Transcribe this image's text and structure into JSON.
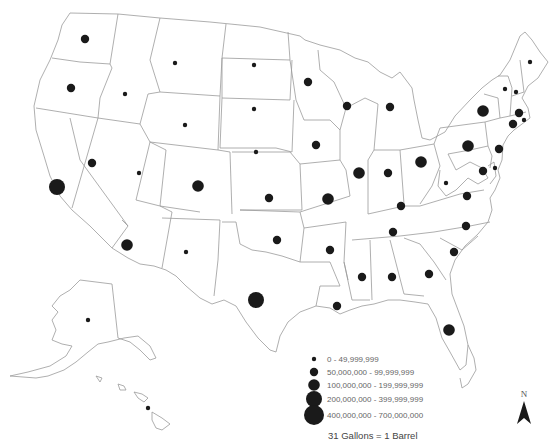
{
  "map": {
    "title": "",
    "subject": "Annual petroleum consumption by state (gallons)",
    "marker_color": "#1a1a1a",
    "border_color": "#9a9a9a"
  },
  "legend": {
    "classes": [
      {
        "id": 1,
        "label": "0 - 49,999,999"
      },
      {
        "id": 2,
        "label": "50,000,000 - 99,999,999"
      },
      {
        "id": 3,
        "label": "100,000,000 - 199,999,999"
      },
      {
        "id": 4,
        "label": "200,000,000 - 399,999,999"
      },
      {
        "id": 5,
        "label": "400,000,000 - 700,000,000"
      }
    ],
    "note": "31 Gallons = 1 Barrel"
  },
  "north_arrow": {
    "label": "N"
  },
  "states": [
    {
      "state": "WA",
      "class": 2
    },
    {
      "state": "OR",
      "class": 2
    },
    {
      "state": "CA",
      "class": 4
    },
    {
      "state": "ID",
      "class": 1
    },
    {
      "state": "MT",
      "class": 1
    },
    {
      "state": "WY",
      "class": 1
    },
    {
      "state": "NV",
      "class": 2
    },
    {
      "state": "UT",
      "class": 1
    },
    {
      "state": "CO",
      "class": 3
    },
    {
      "state": "ND",
      "class": 1
    },
    {
      "state": "SD",
      "class": 1
    },
    {
      "state": "NE",
      "class": 1
    },
    {
      "state": "KS",
      "class": 2
    },
    {
      "state": "OK",
      "class": 2
    },
    {
      "state": "NM",
      "class": 1
    },
    {
      "state": "AZ",
      "class": 3
    },
    {
      "state": "TX",
      "class": 4
    },
    {
      "state": "AK",
      "class": 1
    },
    {
      "state": "HI",
      "class": 1
    },
    {
      "state": "MN",
      "class": 2
    },
    {
      "state": "IA",
      "class": 2
    },
    {
      "state": "MO",
      "class": 3
    },
    {
      "state": "AR",
      "class": 2
    },
    {
      "state": "LA",
      "class": 2
    },
    {
      "state": "WI",
      "class": 2
    },
    {
      "state": "IL",
      "class": 3
    },
    {
      "state": "MI",
      "class": 2
    },
    {
      "state": "IN",
      "class": 2
    },
    {
      "state": "OH",
      "class": 3
    },
    {
      "state": "KY",
      "class": 2
    },
    {
      "state": "TN",
      "class": 2
    },
    {
      "state": "MS",
      "class": 2
    },
    {
      "state": "AL",
      "class": 2
    },
    {
      "state": "GA",
      "class": 2
    },
    {
      "state": "FL",
      "class": 3
    },
    {
      "state": "SC",
      "class": 2
    },
    {
      "state": "NC",
      "class": 2
    },
    {
      "state": "VA",
      "class": 2
    },
    {
      "state": "WV",
      "class": 1
    },
    {
      "state": "PA",
      "class": 3
    },
    {
      "state": "NY",
      "class": 3
    },
    {
      "state": "NJ",
      "class": 2
    },
    {
      "state": "MD",
      "class": 2
    },
    {
      "state": "DE",
      "class": 1
    },
    {
      "state": "VT",
      "class": 1
    },
    {
      "state": "NH",
      "class": 1
    },
    {
      "state": "ME",
      "class": 1
    },
    {
      "state": "MA",
      "class": 2
    },
    {
      "state": "CT",
      "class": 2
    },
    {
      "state": "RI",
      "class": 1
    }
  ]
}
